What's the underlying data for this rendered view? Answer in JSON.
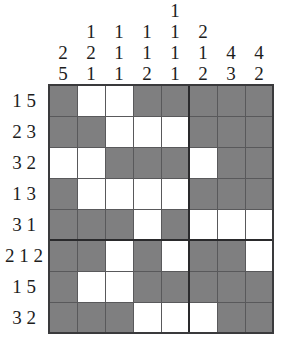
{
  "puzzle": {
    "type": "nonogram",
    "title": "Nonogram",
    "grid_size": {
      "rows": 8,
      "cols": 8
    },
    "block_separator_after_col": 5,
    "block_separator_after_row": 5,
    "colors": {
      "filled": "#7f7f80",
      "empty": "#ffffff",
      "gridline": "#59595b",
      "heavy_gridline": "#2a2a2c",
      "text": "#1d1d1d",
      "background": "#ffffff"
    },
    "column_clues": [
      [
        "2",
        "5"
      ],
      [
        "1",
        "2",
        "1"
      ],
      [
        "1",
        "1",
        "1"
      ],
      [
        "1",
        "1",
        "2"
      ],
      [
        "1",
        "1",
        "1",
        "1"
      ],
      [
        "2",
        "1",
        "2"
      ],
      [
        "4",
        "3"
      ],
      [
        "4",
        "2"
      ]
    ],
    "column_clue_rows": [
      [
        "",
        "",
        "",
        "",
        "1",
        "",
        "",
        ""
      ],
      [
        "",
        "1",
        "1",
        "1",
        "1",
        "2",
        "",
        ""
      ],
      [
        "2",
        "2",
        "1",
        "1",
        "1",
        "1",
        "4",
        "4"
      ],
      [
        "5",
        "1",
        "1",
        "2",
        "1",
        "2",
        "3",
        "2"
      ]
    ],
    "row_clues": [
      "1 5",
      "2 3",
      "3 2",
      "1 3",
      "3 1",
      "2 1 2",
      "1 5",
      "3 2"
    ],
    "row_clue_values": [
      [
        "1",
        "5"
      ],
      [
        "2",
        "3"
      ],
      [
        "3",
        "2"
      ],
      [
        "1",
        "3"
      ],
      [
        "3",
        "1"
      ],
      [
        "2",
        "1",
        "2"
      ],
      [
        "1",
        "5"
      ],
      [
        "3",
        "2"
      ]
    ],
    "cells": [
      [
        1,
        0,
        0,
        1,
        1,
        1,
        1,
        1
      ],
      [
        1,
        1,
        0,
        0,
        0,
        1,
        1,
        1
      ],
      [
        0,
        0,
        1,
        1,
        1,
        0,
        1,
        1
      ],
      [
        1,
        0,
        0,
        0,
        0,
        1,
        1,
        1
      ],
      [
        1,
        1,
        1,
        0,
        1,
        0,
        0,
        0
      ],
      [
        1,
        1,
        0,
        1,
        0,
        1,
        1,
        0
      ],
      [
        1,
        0,
        0,
        1,
        1,
        1,
        1,
        1
      ],
      [
        1,
        1,
        1,
        0,
        0,
        0,
        1,
        1
      ]
    ]
  }
}
